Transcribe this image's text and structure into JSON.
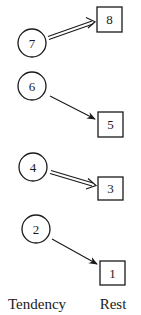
{
  "diagram": {
    "pairs": [
      {
        "tendency": "7",
        "rest": "8",
        "arrow": "double"
      },
      {
        "tendency": "6",
        "rest": "5",
        "arrow": "single"
      },
      {
        "tendency": "4",
        "rest": "3",
        "arrow": "double"
      },
      {
        "tendency": "2",
        "rest": "1",
        "arrow": "single"
      }
    ],
    "labels": {
      "tendency": "Tendency",
      "rest": "Rest"
    }
  },
  "colors": {
    "stroke": "#1a1a1a",
    "background": "#ffffff"
  }
}
